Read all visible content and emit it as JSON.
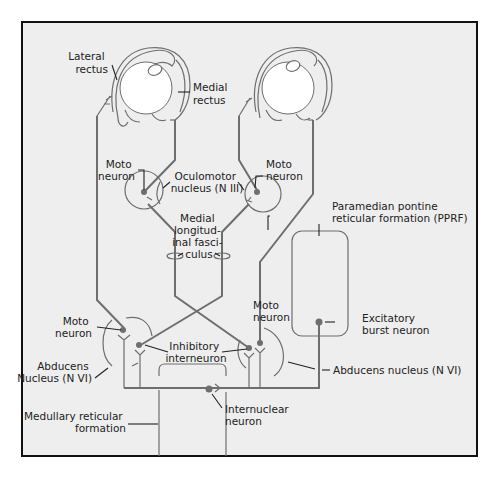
{
  "diagram": {
    "background": "#eeeeee",
    "frame_color": "#111111",
    "pathway_color": "#6e6e6e",
    "labels": {
      "lateral_rectus": [
        "Lateral",
        "rectus"
      ],
      "medial_rectus": [
        "Medial",
        "rectus"
      ],
      "moto_neuron_oculomotor_left": [
        "Moto",
        "neuron"
      ],
      "oculomotor_nucleus": [
        "Oculomotor",
        "nucleus (N III)"
      ],
      "moto_neuron_oculomotor_right": [
        "Moto",
        "neuron"
      ],
      "mlf": [
        "Medial",
        "longitud-",
        "inal fasci-",
        "culus"
      ],
      "pprf": [
        "Paramedian pontine",
        "reticular formation (PPRF)"
      ],
      "moto_neuron_abducens_left": [
        "Moto",
        "neuron"
      ],
      "moto_neuron_abducens_right": [
        "Moto",
        "neuron"
      ],
      "abducens_nucleus_left": [
        "Abducens",
        "Nucleus (N VI)"
      ],
      "inhibitory_interneuron": [
        "Inhibitory",
        "interneuron"
      ],
      "excitatory_burst_neuron": [
        "Excitatory",
        "burst neuron"
      ],
      "abducens_nucleus_right": "Abducens nucleus (N VI)",
      "internuclear_neuron": [
        "Internuclear",
        "neuron"
      ],
      "medullary_reticular_formation": [
        "Medullary reticular",
        "formation"
      ]
    }
  }
}
